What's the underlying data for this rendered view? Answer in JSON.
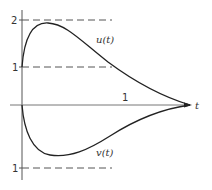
{
  "diagram": {
    "axes": {
      "x_label": "t",
      "x_tick_label": "1",
      "y_tick_labels": {
        "upper_two": "2",
        "upper_one": "1",
        "lower_one": "1"
      }
    },
    "curves": [
      {
        "id": "u",
        "label": "u(t)",
        "start_value": 1,
        "peak_value": 1.9,
        "end_value": 0
      },
      {
        "id": "v",
        "label": "v(t)",
        "start_value": 0,
        "min_value": -1,
        "end_value": 0
      }
    ],
    "reference_lines": [
      {
        "level": 2,
        "style": "dashed"
      },
      {
        "level": 1,
        "style": "dashed"
      },
      {
        "level": -1,
        "style": "dashed"
      }
    ],
    "colors": {
      "line": "#333333",
      "background": "#ffffff"
    }
  }
}
